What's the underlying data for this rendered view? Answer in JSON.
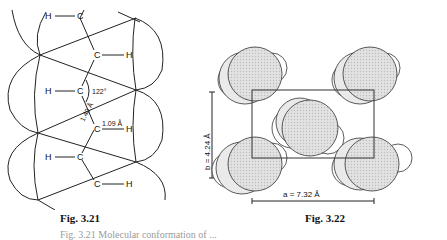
{
  "figures": [
    {
      "id": "fig-3-21",
      "caption": "Fig. 3.21",
      "atoms": {
        "carbon": "C",
        "hydrogen": "H"
      },
      "annotations": {
        "bond_angle": "122°",
        "ch_bond_length": "1.09 Å",
        "cc_bond_length": "1.40 Å"
      }
    },
    {
      "id": "fig-3-22",
      "caption": "Fig. 3.22",
      "annotations": {
        "a_axis": "a = 7.32 Å",
        "b_axis": "b = 4.24 Å"
      }
    }
  ],
  "bottom_caption": "Fig. 3.21   Molecular conformation of ..."
}
